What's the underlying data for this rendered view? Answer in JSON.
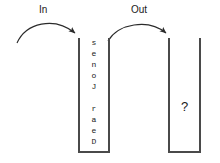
{
  "diagram": {
    "stroke_color": "#4a4a4a",
    "text_color": "#1a1a1a",
    "background_color": "#ffffff"
  },
  "labels": {
    "in": "In",
    "out": "Out"
  },
  "left_container": {
    "name": "input-stack",
    "items_bottom_to_top": [
      "D",
      "e",
      "a",
      "r",
      " ",
      "J",
      "o",
      "n",
      "e",
      "s"
    ],
    "reading": "Dear Jones"
  },
  "right_container": {
    "name": "output-stack",
    "placeholder": "?"
  },
  "arrows": {
    "in_arrow": {
      "label": "In",
      "from": "outside-left",
      "to": "input-stack-top"
    },
    "out_arrow": {
      "label": "Out",
      "from": "input-stack-top",
      "to": "output-stack-top"
    }
  }
}
